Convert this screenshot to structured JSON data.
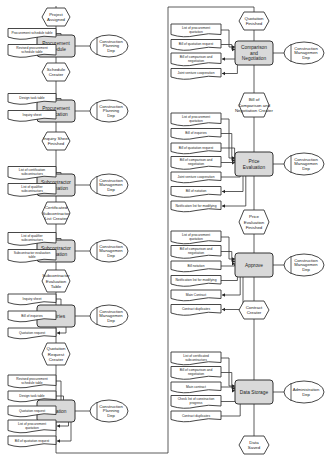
{
  "colors": {
    "function_fill": "#d9d9d9",
    "line": "#333333",
    "background": "#ffffff"
  },
  "left_column": [
    {
      "event": [
        "Project",
        "Assigned"
      ],
      "function": [
        "Procurement",
        "Schedule"
      ],
      "org": [
        "Construction",
        "Planning",
        "Dep"
      ],
      "inputs": [
        [
          "Procurement schedule table"
        ]
      ],
      "outputs": [
        [
          "Revised procurement",
          "schedule table"
        ]
      ]
    },
    {
      "event": [
        "Schedule",
        "Creater"
      ],
      "function": [
        "Procurement",
        "Verification"
      ],
      "org": [
        "Construction",
        "Planning",
        "Dep"
      ],
      "inputs": [
        [
          "Design task table"
        ]
      ],
      "outputs": [
        [
          "Inquiry sheet"
        ]
      ]
    },
    {
      "event": [
        "Inquiry Sheet",
        "Finished"
      ],
      "function": [
        "Subcontractor",
        "Information"
      ],
      "org": [
        "Construction",
        "Managemen",
        "Dep"
      ],
      "inputs": [
        [
          "List of certification",
          "subcontractors"
        ]
      ],
      "outputs": [
        [
          "List of qualifier",
          "subcontractors"
        ]
      ]
    },
    {
      "event": [
        "Certificated",
        "Subcontractor",
        "List Creater"
      ],
      "function": [
        "Subcontractor",
        "Evaluation"
      ],
      "org": [
        "Construction",
        "Managemen",
        "Dep"
      ],
      "inputs": [
        [
          "List of qualifier",
          "subcontractors"
        ]
      ],
      "outputs": [
        [
          "Subcontractor evaluation",
          "table"
        ]
      ]
    },
    {
      "event": [
        "Subcontractor",
        "Evaluation",
        "Table"
      ],
      "function": [
        "Inquiries"
      ],
      "org": [
        "Construction",
        "Managemen",
        "Dep"
      ],
      "inputs": [
        [
          "Inquiry sheet"
        ]
      ],
      "outputs": [
        [
          "Bill of inquiries"
        ],
        [
          "Quotation request"
        ]
      ]
    },
    {
      "event": [
        "Quotation",
        "Request",
        "Creater"
      ],
      "function": [
        "Quotation"
      ],
      "org": [
        "Construction",
        "Planning",
        "Dep"
      ],
      "inputs": [
        [
          "Revised procurement",
          "schedule table"
        ],
        [
          "Design task table"
        ],
        [
          "Quotation request"
        ]
      ],
      "outputs": [
        [
          "List of procurement",
          "quotation"
        ],
        [
          "Bill of quotation request"
        ]
      ]
    }
  ],
  "right_column": [
    {
      "event": [
        "Quotation",
        "Finished"
      ],
      "function": [
        "Comparison",
        "and",
        "Negotiation"
      ],
      "org": [
        "Construction",
        "Managemen",
        "Dep"
      ],
      "inputs": [
        [
          "List of procurement",
          "quotation"
        ],
        [
          "Bill of quotation request"
        ]
      ],
      "outputs": [
        [
          "Bill of comparison and",
          "negotiation"
        ],
        [
          "Joint venture cooperation"
        ]
      ]
    },
    {
      "event": [
        "Bill of",
        "Comparison and",
        "Negotiation Creater"
      ],
      "function": [
        "Price",
        "Evaluation"
      ],
      "org": [
        "Construction",
        "Managemen",
        "Dep"
      ],
      "inputs": [
        [
          "List of procurement",
          "quotation"
        ],
        [
          "Bill of inquiries"
        ],
        [
          "Bill of quotation request"
        ],
        [
          "Bill of comparison and",
          "negotiation"
        ],
        [
          "Joint venture cooperation"
        ]
      ],
      "outputs": [
        [
          "Bill of notation"
        ],
        [
          "Notification list for modifying"
        ]
      ]
    },
    {
      "event": [
        "Price",
        "Evaluation",
        "Finished"
      ],
      "function": [
        "Approve"
      ],
      "org": [
        "Construction",
        "Managemen",
        "Dep"
      ],
      "inputs": [
        [
          "List of procurement",
          "quotation"
        ],
        [
          "Bill of comparison and",
          "negotiation"
        ],
        [
          "Bill notation"
        ],
        [
          "Notification list for modifying"
        ]
      ],
      "outputs": [
        [
          "Main Contract"
        ],
        [
          "Contract duplicates"
        ]
      ]
    },
    {
      "event": [
        "Contract",
        "Creater"
      ],
      "function": [
        "Data Storage"
      ],
      "org": [
        "Administration",
        "Dep"
      ],
      "inputs": [
        [
          "List of certificated",
          "subcontractors"
        ],
        [
          "Bill of comparison and",
          "negotiation"
        ],
        [
          "Main contract"
        ],
        [
          "Check list of construction",
          "progress"
        ],
        [
          "Contract duplicates"
        ]
      ],
      "outputs": []
    },
    {
      "event": [
        "Data",
        "Saved"
      ]
    }
  ]
}
